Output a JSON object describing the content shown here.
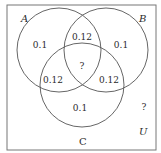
{
  "diagram": {
    "type": "venn-3-set",
    "colors": {
      "stroke": "#555555",
      "text": "#2a2a2a",
      "background": "#ffffff"
    },
    "universe": {
      "label": "U",
      "outside_value": "?"
    },
    "sets": [
      {
        "label": "A"
      },
      {
        "label": "B"
      },
      {
        "label": "C"
      }
    ],
    "regions": {
      "A_only": "0.1",
      "B_only": "0.1",
      "C_only": "0.1",
      "A_and_B": "0.12",
      "A_and_C": "0.12",
      "B_and_C": "0.12",
      "A_and_B_and_C": "?"
    }
  }
}
